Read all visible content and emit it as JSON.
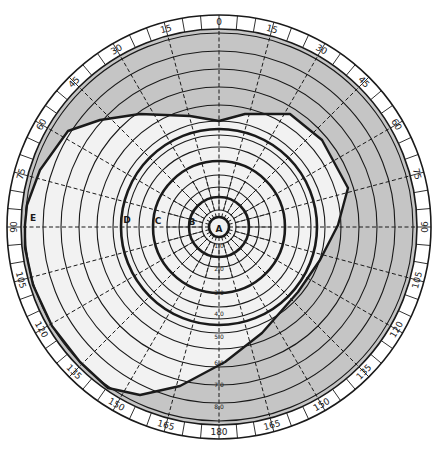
{
  "diagram": {
    "type": "polar visual field chart (perimetry)",
    "center": [
      219,
      227
    ],
    "outer_radius": 212,
    "scale_band_width": 14,
    "colors": {
      "background": "#ffffff",
      "paper": "#f2f2f2",
      "shaded_region": "#bdbdbd",
      "lines": "#1a1a1a"
    },
    "angle_labels": [
      "0",
      "15",
      "30",
      "45",
      "60",
      "75",
      "90",
      "105",
      "120",
      "135",
      "150",
      "165",
      "180",
      "165",
      "150",
      "135",
      "120",
      "105",
      "90",
      "75",
      "60",
      "45",
      "30",
      "15"
    ],
    "eccentricity_labels": [
      "1.0",
      "2.0",
      "3.0",
      "4.0",
      "5.0",
      "6.0",
      "7.0",
      "8.0"
    ],
    "zone_labels": {
      "A": "A",
      "B": "B",
      "C": "C",
      "D": "D",
      "E": "E"
    },
    "rings": [
      {
        "r": 10,
        "heavy": true
      },
      {
        "r": 17,
        "heavy": false
      },
      {
        "r": 30,
        "heavy": true
      },
      {
        "r": 40,
        "heavy": false
      },
      {
        "r": 52,
        "heavy": false
      },
      {
        "r": 66,
        "heavy": true
      },
      {
        "r": 80,
        "heavy": false
      },
      {
        "r": 92,
        "heavy": false
      },
      {
        "r": 98,
        "heavy": true
      },
      {
        "r": 106,
        "heavy": false
      },
      {
        "r": 122,
        "heavy": false
      },
      {
        "r": 140,
        "heavy": false
      },
      {
        "r": 158,
        "heavy": false
      },
      {
        "r": 176,
        "heavy": false
      },
      {
        "r": 194,
        "heavy": false
      }
    ],
    "field_boundary_points": [
      [
        68,
        131
      ],
      [
        100,
        120
      ],
      [
        140,
        114
      ],
      [
        190,
        116
      ],
      [
        219,
        121
      ],
      [
        245,
        114
      ],
      [
        290,
        114
      ],
      [
        322,
        140
      ],
      [
        348,
        188
      ],
      [
        338,
        225
      ],
      [
        320,
        260
      ],
      [
        298,
        292
      ],
      [
        262,
        333
      ],
      [
        225,
        362
      ],
      [
        180,
        386
      ],
      [
        140,
        395
      ],
      [
        108,
        388
      ],
      [
        80,
        362
      ],
      [
        52,
        326
      ],
      [
        33,
        285
      ],
      [
        25,
        248
      ],
      [
        25,
        225
      ],
      [
        27,
        205
      ],
      [
        40,
        170
      ]
    ]
  }
}
